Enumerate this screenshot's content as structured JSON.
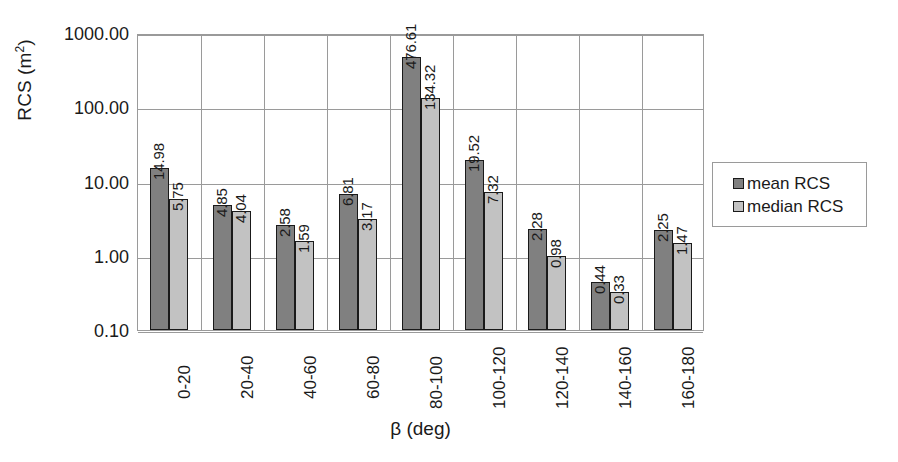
{
  "chart_data": {
    "type": "bar",
    "title": "",
    "subtitle": "",
    "xlabel": "β (deg)",
    "ylabel": "RCS (m²)",
    "ylabel_base": "RCS (m",
    "ylabel_sup": "2",
    "ylabel_tail": ")",
    "yscale": "log",
    "ylim": [
      0.1,
      1000
    ],
    "ytick_labels": [
      "1000.00",
      "100.00",
      "10.00",
      "1.00",
      "0.10"
    ],
    "ytick_values": [
      1000,
      100,
      10,
      1,
      0.1
    ],
    "grid": "horizontal-and-vertical",
    "legend_position": "right-outside",
    "categories": [
      "0-20",
      "20-40",
      "40-60",
      "60-80",
      "80-100",
      "100-120",
      "120-140",
      "140-160",
      "160-180"
    ],
    "series": [
      {
        "name": "mean RCS",
        "color": "#808080",
        "values": [
          14.98,
          4.85,
          2.58,
          6.81,
          476.61,
          19.52,
          2.28,
          0.44,
          2.25
        ],
        "labels": [
          "14.98",
          "4.85",
          "2.58",
          "6.81",
          "476.61",
          "19.52",
          "2.28",
          "0.44",
          "2.25"
        ]
      },
      {
        "name": "median RCS",
        "color": "#c2c2c2",
        "values": [
          5.75,
          4.04,
          1.59,
          3.17,
          134.32,
          7.32,
          0.98,
          0.33,
          1.47
        ],
        "labels": [
          "5.75",
          "4.04",
          "1.59",
          "3.17",
          "134.32",
          "7.32",
          "0.98",
          "0.33",
          "1.47"
        ]
      }
    ]
  },
  "legend": {
    "entries": [
      {
        "label": "mean RCS",
        "color": "#808080"
      },
      {
        "label": "median RCS",
        "color": "#c2c2c2"
      }
    ]
  },
  "axes": {
    "x_title": "β (deg)",
    "y_title": "RCS (m²)"
  },
  "colors": {
    "mean_bar": "#808080",
    "median_bar": "#c2c2c2",
    "bar_outline": "#1a1a1a",
    "gridline": "#9a9a9a",
    "background": "#ffffff",
    "text": "#1a1a1a"
  }
}
